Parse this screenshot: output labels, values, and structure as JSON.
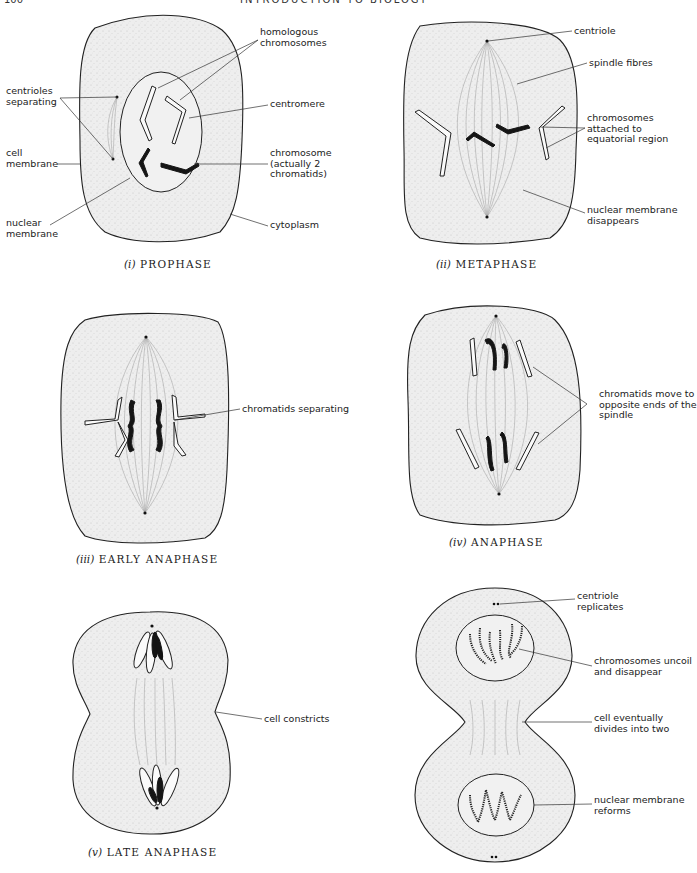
{
  "page": {
    "number": "100",
    "running_title": "INTRODUCTION TO BIOLOGY"
  },
  "panels": [
    {
      "id": "prophase",
      "caption_numeral": "(i)",
      "caption_title": "PROPHASE",
      "labels": {
        "homologous": "homologous\nchromosomes",
        "centrioles": "centrioles\nseparating",
        "centromere": "centromere",
        "cell_membrane": "cell\nmembrane",
        "chromosome": "chromosome\n(actually 2\nchromatids)",
        "nuclear_membrane": "nuclear\nmembrane",
        "cytoplasm": "cytoplasm"
      }
    },
    {
      "id": "metaphase",
      "caption_numeral": "(ii)",
      "caption_title": "METAPHASE",
      "labels": {
        "centriole": "centriole",
        "spindle_fibres": "spindle fibres",
        "chromosomes_attached": "chromosomes\nattached to\nequatorial region",
        "nuclear_disappears": "nuclear membrane\ndisappears"
      }
    },
    {
      "id": "early-anaphase",
      "caption_numeral": "(iii)",
      "caption_title": "EARLY ANAPHASE",
      "labels": {
        "chromatids_separating": "chromatids separating"
      }
    },
    {
      "id": "anaphase",
      "caption_numeral": "(iv)",
      "caption_title": "ANAPHASE",
      "labels": {
        "chromatids_move": "chromatids move to\nopposite ends of the\nspindle"
      }
    },
    {
      "id": "late-anaphase",
      "caption_numeral": "(v)",
      "caption_title": "LATE ANAPHASE",
      "labels": {
        "cell_constricts": "cell constricts"
      }
    },
    {
      "id": "telophase",
      "caption_numeral": "",
      "caption_title": "",
      "labels": {
        "centriole_replicates": "centriole\nreplicates",
        "chromosomes_uncoil": "chromosomes uncoil\nand disappear",
        "cell_divides": "cell eventually\ndivides into two",
        "nuclear_reforms": "nuclear membrane\nreforms"
      }
    }
  ]
}
